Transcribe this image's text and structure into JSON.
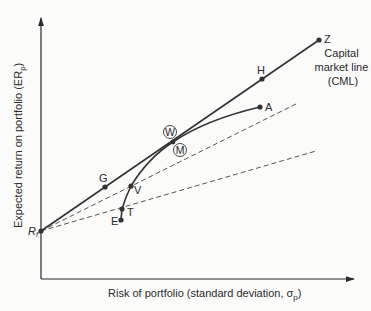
{
  "diagram": {
    "title": "Capital market line",
    "axes": {
      "x_label": "Risk of portfolio (standard deviation, σ",
      "x_label_sub": "p",
      "x_label_close": ")",
      "y_label": "Expected return on portfolio (ER",
      "y_label_sub": "p",
      "y_label_close": ")"
    },
    "origin_label": "R",
    "origin_label_sub": "f",
    "cml_label": [
      "Capital",
      "market line",
      "(CML)"
    ],
    "points": {
      "Z": "Z",
      "H": "H",
      "A": "A",
      "W": "W",
      "M": "M",
      "G": "G",
      "V": "V",
      "T": "T",
      "E": "E"
    },
    "colors": {
      "line": "#333333",
      "dashed": "#555555",
      "background": "#fbfbfa"
    }
  }
}
